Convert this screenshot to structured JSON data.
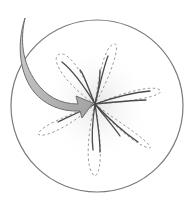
{
  "figure": {
    "colors": {
      "background": "#ffffff",
      "circle_stroke": "#7a7a7a",
      "petal_dashed": "#9a9a9a",
      "petal_solid": "#4a4a4a",
      "arrow_fill": "#b8b8b8",
      "arrow_stroke": "#6e6e6e",
      "center_glow": "#eeeeee"
    },
    "circle": {
      "cx": 97,
      "cy": 106,
      "r": 86
    },
    "center": {
      "x": 95,
      "y": 104
    },
    "petals": [
      {
        "name": "upper-left",
        "tip": [
          58,
          55
        ]
      },
      {
        "name": "upper",
        "tip": [
          114,
          44
        ]
      },
      {
        "name": "right",
        "tip": [
          160,
          90
        ]
      },
      {
        "name": "lower-right",
        "tip": [
          150,
          148
        ]
      },
      {
        "name": "lower",
        "tip": [
          95,
          176
        ]
      },
      {
        "name": "lower-left",
        "tip": [
          38,
          134
        ]
      }
    ],
    "arrow": {
      "tail": [
        25,
        18
      ],
      "head_tip": [
        93,
        104
      ]
    }
  }
}
